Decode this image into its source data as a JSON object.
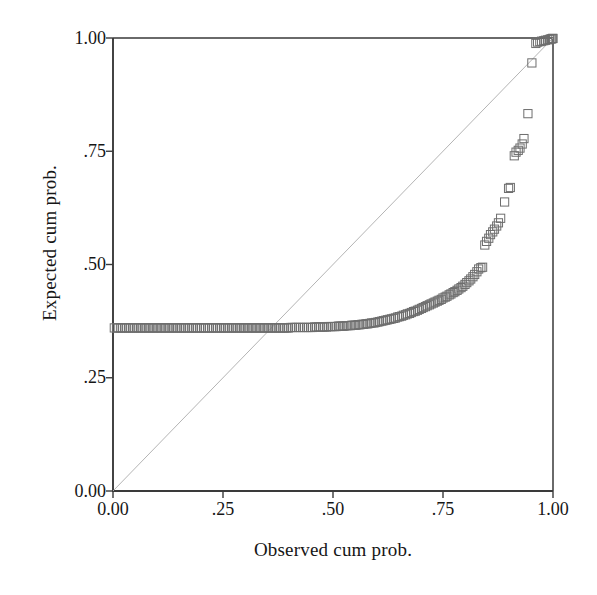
{
  "chart_data": {
    "type": "scatter",
    "title": "",
    "subtitle": "",
    "xlabel": "Observed cum prob.",
    "ylabel": "Expected cum prob.",
    "xlim": [
      0.0,
      1.0
    ],
    "ylim": [
      0.0,
      1.0
    ],
    "xticks": [
      0.0,
      0.25,
      0.5,
      0.75,
      1.0
    ],
    "yticks": [
      0.0,
      0.25,
      0.5,
      0.75,
      1.0
    ],
    "xticklabels": [
      "0.00",
      ".25",
      ".50",
      ".75",
      "1.00"
    ],
    "yticklabels": [
      "0.00",
      ".25",
      ".50",
      ".75",
      "1.00"
    ],
    "grid": false,
    "legend": null,
    "marker": "open-square",
    "marker_color": "#6e6e6e",
    "reference_line": {
      "name": "identity-diagonal",
      "from": [
        0.0,
        0.0
      ],
      "to": [
        1.0,
        1.0
      ],
      "color": "#b4b4b4",
      "width": 1
    },
    "series": [
      {
        "name": "P-P plot points",
        "points": [
          [
            0.003,
            0.36
          ],
          [
            0.008,
            0.36
          ],
          [
            0.012,
            0.36
          ],
          [
            0.017,
            0.36
          ],
          [
            0.021,
            0.36
          ],
          [
            0.026,
            0.36
          ],
          [
            0.03,
            0.36
          ],
          [
            0.035,
            0.36
          ],
          [
            0.039,
            0.36
          ],
          [
            0.044,
            0.36
          ],
          [
            0.048,
            0.36
          ],
          [
            0.053,
            0.36
          ],
          [
            0.057,
            0.36
          ],
          [
            0.062,
            0.36
          ],
          [
            0.066,
            0.36
          ],
          [
            0.071,
            0.36
          ],
          [
            0.075,
            0.36
          ],
          [
            0.08,
            0.36
          ],
          [
            0.084,
            0.36
          ],
          [
            0.089,
            0.36
          ],
          [
            0.093,
            0.36
          ],
          [
            0.098,
            0.36
          ],
          [
            0.102,
            0.36
          ],
          [
            0.107,
            0.36
          ],
          [
            0.111,
            0.36
          ],
          [
            0.116,
            0.36
          ],
          [
            0.12,
            0.36
          ],
          [
            0.125,
            0.36
          ],
          [
            0.129,
            0.36
          ],
          [
            0.134,
            0.36
          ],
          [
            0.138,
            0.36
          ],
          [
            0.143,
            0.36
          ],
          [
            0.147,
            0.36
          ],
          [
            0.152,
            0.36
          ],
          [
            0.156,
            0.36
          ],
          [
            0.161,
            0.36
          ],
          [
            0.165,
            0.36
          ],
          [
            0.17,
            0.36
          ],
          [
            0.174,
            0.36
          ],
          [
            0.179,
            0.36
          ],
          [
            0.183,
            0.36
          ],
          [
            0.188,
            0.36
          ],
          [
            0.192,
            0.36
          ],
          [
            0.197,
            0.36
          ],
          [
            0.201,
            0.36
          ],
          [
            0.206,
            0.36
          ],
          [
            0.21,
            0.36
          ],
          [
            0.215,
            0.36
          ],
          [
            0.219,
            0.36
          ],
          [
            0.224,
            0.36
          ],
          [
            0.228,
            0.36
          ],
          [
            0.233,
            0.36
          ],
          [
            0.237,
            0.36
          ],
          [
            0.242,
            0.36
          ],
          [
            0.246,
            0.36
          ],
          [
            0.251,
            0.36
          ],
          [
            0.255,
            0.36
          ],
          [
            0.26,
            0.36
          ],
          [
            0.264,
            0.36
          ],
          [
            0.269,
            0.36
          ],
          [
            0.273,
            0.36
          ],
          [
            0.278,
            0.36
          ],
          [
            0.282,
            0.36
          ],
          [
            0.287,
            0.36
          ],
          [
            0.291,
            0.36
          ],
          [
            0.296,
            0.36
          ],
          [
            0.3,
            0.36
          ],
          [
            0.305,
            0.36
          ],
          [
            0.309,
            0.36
          ],
          [
            0.314,
            0.36
          ],
          [
            0.318,
            0.36
          ],
          [
            0.323,
            0.36
          ],
          [
            0.327,
            0.36
          ],
          [
            0.332,
            0.36
          ],
          [
            0.336,
            0.36
          ],
          [
            0.341,
            0.36
          ],
          [
            0.345,
            0.36
          ],
          [
            0.35,
            0.36
          ],
          [
            0.354,
            0.36
          ],
          [
            0.359,
            0.36
          ],
          [
            0.363,
            0.36
          ],
          [
            0.368,
            0.36
          ],
          [
            0.372,
            0.36
          ],
          [
            0.377,
            0.36
          ],
          [
            0.381,
            0.36
          ],
          [
            0.386,
            0.36
          ],
          [
            0.39,
            0.36
          ],
          [
            0.395,
            0.36
          ],
          [
            0.399,
            0.36
          ],
          [
            0.404,
            0.361
          ],
          [
            0.408,
            0.361
          ],
          [
            0.413,
            0.361
          ],
          [
            0.417,
            0.361
          ],
          [
            0.422,
            0.361
          ],
          [
            0.426,
            0.361
          ],
          [
            0.431,
            0.361
          ],
          [
            0.435,
            0.361
          ],
          [
            0.44,
            0.361
          ],
          [
            0.444,
            0.361
          ],
          [
            0.449,
            0.361
          ],
          [
            0.453,
            0.361
          ],
          [
            0.458,
            0.362
          ],
          [
            0.462,
            0.362
          ],
          [
            0.467,
            0.362
          ],
          [
            0.471,
            0.362
          ],
          [
            0.476,
            0.362
          ],
          [
            0.48,
            0.362
          ],
          [
            0.485,
            0.362
          ],
          [
            0.489,
            0.363
          ],
          [
            0.494,
            0.363
          ],
          [
            0.498,
            0.363
          ],
          [
            0.503,
            0.363
          ],
          [
            0.507,
            0.363
          ],
          [
            0.512,
            0.364
          ],
          [
            0.516,
            0.364
          ],
          [
            0.521,
            0.364
          ],
          [
            0.525,
            0.364
          ],
          [
            0.53,
            0.365
          ],
          [
            0.534,
            0.365
          ],
          [
            0.539,
            0.365
          ],
          [
            0.543,
            0.366
          ],
          [
            0.548,
            0.366
          ],
          [
            0.552,
            0.366
          ],
          [
            0.557,
            0.367
          ],
          [
            0.561,
            0.367
          ],
          [
            0.566,
            0.368
          ],
          [
            0.57,
            0.368
          ],
          [
            0.575,
            0.369
          ],
          [
            0.579,
            0.369
          ],
          [
            0.584,
            0.37
          ],
          [
            0.588,
            0.371
          ],
          [
            0.593,
            0.371
          ],
          [
            0.597,
            0.372
          ],
          [
            0.602,
            0.373
          ],
          [
            0.606,
            0.374
          ],
          [
            0.611,
            0.375
          ],
          [
            0.615,
            0.376
          ],
          [
            0.62,
            0.377
          ],
          [
            0.624,
            0.378
          ],
          [
            0.629,
            0.379
          ],
          [
            0.633,
            0.38
          ],
          [
            0.638,
            0.381
          ],
          [
            0.642,
            0.382
          ],
          [
            0.647,
            0.384
          ],
          [
            0.651,
            0.385
          ],
          [
            0.656,
            0.386
          ],
          [
            0.66,
            0.388
          ],
          [
            0.665,
            0.389
          ],
          [
            0.669,
            0.391
          ],
          [
            0.674,
            0.392
          ],
          [
            0.678,
            0.394
          ],
          [
            0.683,
            0.396
          ],
          [
            0.687,
            0.397
          ],
          [
            0.692,
            0.399
          ],
          [
            0.696,
            0.401
          ],
          [
            0.701,
            0.403
          ],
          [
            0.705,
            0.405
          ],
          [
            0.71,
            0.407
          ],
          [
            0.714,
            0.409
          ],
          [
            0.719,
            0.411
          ],
          [
            0.723,
            0.413
          ],
          [
            0.728,
            0.415
          ],
          [
            0.732,
            0.417
          ],
          [
            0.737,
            0.419
          ],
          [
            0.741,
            0.421
          ],
          [
            0.746,
            0.423
          ],
          [
            0.75,
            0.426
          ],
          [
            0.755,
            0.428
          ],
          [
            0.759,
            0.43
          ],
          [
            0.764,
            0.433
          ],
          [
            0.768,
            0.435
          ],
          [
            0.773,
            0.438
          ],
          [
            0.777,
            0.44
          ],
          [
            0.782,
            0.443
          ],
          [
            0.786,
            0.446
          ],
          [
            0.791,
            0.449
          ],
          [
            0.795,
            0.452
          ],
          [
            0.8,
            0.456
          ],
          [
            0.804,
            0.46
          ],
          [
            0.809,
            0.464
          ],
          [
            0.813,
            0.468
          ],
          [
            0.818,
            0.473
          ],
          [
            0.822,
            0.478
          ],
          [
            0.827,
            0.484
          ],
          [
            0.831,
            0.49
          ],
          [
            0.836,
            0.493
          ],
          [
            0.84,
            0.494
          ],
          [
            0.845,
            0.543
          ],
          [
            0.849,
            0.551
          ],
          [
            0.854,
            0.558
          ],
          [
            0.858,
            0.566
          ],
          [
            0.863,
            0.572
          ],
          [
            0.867,
            0.578
          ],
          [
            0.872,
            0.585
          ],
          [
            0.876,
            0.592
          ],
          [
            0.881,
            0.602
          ],
          [
            0.89,
            0.638
          ],
          [
            0.899,
            0.668
          ],
          [
            0.903,
            0.67
          ],
          [
            0.912,
            0.74
          ],
          [
            0.916,
            0.748
          ],
          [
            0.921,
            0.752
          ],
          [
            0.925,
            0.757
          ],
          [
            0.93,
            0.766
          ],
          [
            0.934,
            0.778
          ],
          [
            0.943,
            0.833
          ],
          [
            0.952,
            0.945
          ],
          [
            0.961,
            0.988
          ],
          [
            0.965,
            0.991
          ],
          [
            0.97,
            0.992
          ],
          [
            0.974,
            0.993
          ],
          [
            0.979,
            0.994
          ],
          [
            0.983,
            0.995
          ],
          [
            0.988,
            0.996
          ],
          [
            0.992,
            0.997
          ],
          [
            0.995,
            0.998
          ],
          [
            0.997,
            0.998
          ],
          [
            0.999,
            0.999
          ],
          [
            1.0,
            0.999
          ]
        ]
      }
    ]
  },
  "axes": {
    "frame_color": "#3a3a3a",
    "background": "#ffffff"
  }
}
